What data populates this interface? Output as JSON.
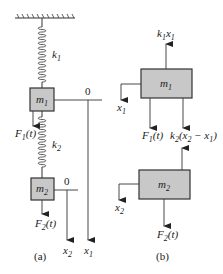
{
  "diagram": {
    "colors": {
      "mass_fill": "#c8c8c8",
      "stroke": "#333333"
    },
    "panel_a": {
      "caption": "(a)",
      "spring1_label": "k",
      "spring1_sub": "1",
      "spring2_label": "k",
      "spring2_sub": "2",
      "mass1_label": "m",
      "mass1_sub": "1",
      "mass2_label": "m",
      "mass2_sub": "2",
      "force1_label": "F",
      "force1_sub": "1",
      "force1_arg": "(t)",
      "force2_label": "F",
      "force2_sub": "2",
      "force2_arg": "(t)",
      "origin1": "0",
      "origin2": "0",
      "axis1_label": "x",
      "axis1_sub": "1",
      "axis2_label": "x",
      "axis2_sub": "2"
    },
    "panel_b": {
      "caption": "(b)",
      "mass1_label": "m",
      "mass1_sub": "1",
      "mass2_label": "m",
      "mass2_sub": "2",
      "spring_force_up_k": "k",
      "spring_force_up_ksub": "1",
      "spring_force_up_x": "x",
      "spring_force_up_xsub": "1",
      "force1_label": "F",
      "force1_sub": "1",
      "force1_arg": "(t)",
      "coupling_k": "k",
      "coupling_ksub": "2",
      "coupling_open": "(x",
      "coupling_x2sub": "2",
      "coupling_minus": " − x",
      "coupling_x1sub": "1",
      "coupling_close": ")",
      "disp1_label": "x",
      "disp1_sub": "1",
      "disp2_label": "x",
      "disp2_sub": "2",
      "force2_label": "F",
      "force2_sub": "2",
      "force2_arg": "(t)"
    }
  }
}
